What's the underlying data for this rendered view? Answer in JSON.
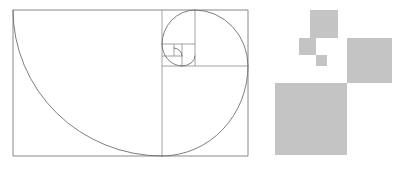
{
  "figure": {
    "background_color": "#ffffff",
    "canvas": {
      "width": 401,
      "height": 170
    }
  },
  "golden_rectangle": {
    "name": "golden-rectangle",
    "stroke_color": "#7a7a7a",
    "stroke_width": 0.9,
    "x": 13,
    "y": 10,
    "width": 235,
    "height": 146,
    "ratio_label": "1.618",
    "outline_points": "13,10 248,10 248,156 13,156 13,10"
  },
  "subdivisions": {
    "name": "fibonacci-subdivisions",
    "stroke_color": "#8a8a8a",
    "stroke_width": 0.8,
    "lines": [
      {
        "name": "divider-1",
        "x1": 162,
        "y1": 10,
        "x2": 162,
        "y2": 156
      },
      {
        "name": "divider-2",
        "x1": 162,
        "y1": 66,
        "x2": 248,
        "y2": 66
      },
      {
        "name": "divider-3",
        "x1": 195,
        "y1": 10,
        "x2": 195,
        "y2": 66
      },
      {
        "name": "divider-4",
        "x1": 162,
        "y1": 44,
        "x2": 195,
        "y2": 44
      },
      {
        "name": "divider-5",
        "x1": 182,
        "y1": 44,
        "x2": 182,
        "y2": 66
      },
      {
        "name": "divider-6",
        "x1": 182,
        "y1": 56,
        "x2": 162,
        "y2": 56
      },
      {
        "name": "divider-7",
        "x1": 174,
        "y1": 44,
        "x2": 174,
        "y2": 56
      }
    ]
  },
  "spiral": {
    "name": "golden-spiral",
    "stroke_color": "#6f6f6f",
    "stroke_width": 0.9,
    "direction": "counter-clockwise",
    "arcs": [
      {
        "name": "arc-1-largest",
        "d": "M 13,10 A 149,146 0 0 0 162,156",
        "radius": 146
      },
      {
        "name": "arc-2",
        "d": "M 162,156 A 86,90 0 0 0 248,66",
        "radius": 88
      },
      {
        "name": "arc-3",
        "d": "M 248,66 A 53,56 0 0 0 195,10",
        "radius": 55
      },
      {
        "name": "arc-4",
        "d": "M 195,10 A 33,34 0 0 0 162,44",
        "radius": 33
      },
      {
        "name": "arc-5",
        "d": "M 162,44 A 20,22 0 0 0 182,66",
        "radius": 21
      },
      {
        "name": "arc-6",
        "d": "M 182,66 A 13,10 0 0 0 195,56",
        "radius": 12
      },
      {
        "name": "arc-7-smallest",
        "d": "M 182,56 A 8,8 0 0 0 174,48",
        "radius": 8
      }
    ]
  },
  "gray_squares": {
    "name": "fibonacci-squares-group",
    "fill_color": "#c4c4c4",
    "items": [
      {
        "name": "square-large",
        "label": "large",
        "x": 275,
        "y": 83,
        "size": 72
      },
      {
        "name": "square-medium",
        "label": "medium",
        "x": 347,
        "y": 38,
        "size": 45
      },
      {
        "name": "square-small",
        "label": "small",
        "x": 310,
        "y": 10,
        "size": 28
      },
      {
        "name": "square-smaller",
        "label": "smaller",
        "x": 299,
        "y": 38,
        "size": 17
      },
      {
        "name": "square-tiny",
        "label": "tiny",
        "x": 316,
        "y": 55,
        "size": 11
      }
    ]
  }
}
